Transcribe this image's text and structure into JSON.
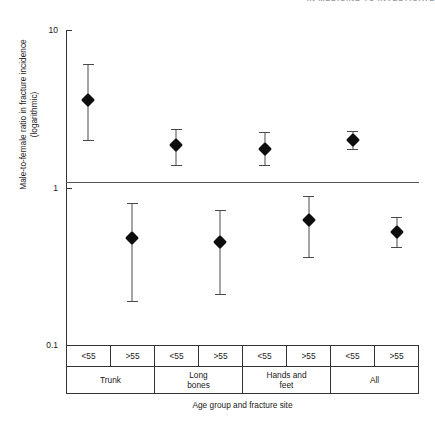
{
  "running_head": "IN MEDICINE TO INVESTIGATE",
  "chart_data": {
    "type": "scatter",
    "title": "",
    "xlabel": "Age group and fracture site",
    "ylabel": "Male-to-female ratio in fracture incidence (logarithmic)",
    "ylabel_line1": "Male-to-female ratio in fracture incidence",
    "ylabel_line2": "(logarithmic)",
    "yscale": "log",
    "ylim": [
      0.1,
      10
    ],
    "ytick_labels": [
      "10",
      "1",
      "0.1"
    ],
    "ytick_values": [
      10,
      1,
      0.1
    ],
    "grid": false,
    "legend": null,
    "reference_line": 1,
    "group_labels": [
      "Trunk",
      "Long bones",
      "Hands and feet",
      "All"
    ],
    "age_labels": [
      "<55",
      ">55"
    ],
    "categories": [
      "Trunk <55",
      "Trunk >55",
      "Long bones <55",
      "Long bones >55",
      "Hands and feet <55",
      "Hands and feet >55",
      "All <55",
      "All >55"
    ],
    "values": [
      3.6,
      0.48,
      1.85,
      0.45,
      1.75,
      0.62,
      2.0,
      0.52
    ],
    "ci_lower": [
      2.0,
      0.19,
      1.38,
      0.21,
      1.38,
      0.36,
      1.75,
      0.42
    ],
    "ci_upper": [
      6.1,
      0.8,
      2.35,
      0.72,
      2.25,
      0.88,
      2.3,
      0.65
    ],
    "marker": "diamond",
    "marker_color": "#0d0d0d",
    "errorbar_color": "#4a4a4a"
  },
  "groups": [
    {
      "name": "Trunk",
      "points": [
        {
          "age": "<55",
          "value": 3.6,
          "lower": 2.0,
          "upper": 6.1
        },
        {
          "age": ">55",
          "value": 0.48,
          "lower": 0.19,
          "upper": 0.8
        }
      ]
    },
    {
      "name": "Long\nbones",
      "points": [
        {
          "age": "<55",
          "value": 1.85,
          "lower": 1.38,
          "upper": 2.35
        },
        {
          "age": ">55",
          "value": 0.45,
          "lower": 0.21,
          "upper": 0.72
        }
      ]
    },
    {
      "name": "Hands and\nfeet",
      "points": [
        {
          "age": "<55",
          "value": 1.75,
          "lower": 1.38,
          "upper": 2.25
        },
        {
          "age": ">55",
          "value": 0.62,
          "lower": 0.36,
          "upper": 0.88
        }
      ]
    },
    {
      "name": "All",
      "points": [
        {
          "age": "<55",
          "value": 2.0,
          "lower": 1.75,
          "upper": 2.3
        },
        {
          "age": ">55",
          "value": 0.52,
          "lower": 0.42,
          "upper": 0.65
        }
      ]
    }
  ]
}
